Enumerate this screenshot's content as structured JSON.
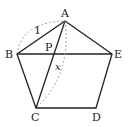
{
  "diagram": {
    "type": "geometry",
    "shape": "regular pentagon",
    "vertices": [
      {
        "label": "A",
        "x": 65,
        "y": 21
      },
      {
        "label": "B",
        "x": 17,
        "y": 54
      },
      {
        "label": "C",
        "x": 36,
        "y": 108
      },
      {
        "label": "D",
        "x": 96,
        "y": 108
      },
      {
        "label": "E",
        "x": 112,
        "y": 54
      }
    ],
    "intersection": {
      "label": "P",
      "x": 53,
      "y": 54
    },
    "segments": [
      "AB",
      "BC",
      "CD",
      "DE",
      "EA",
      "BE",
      "AC"
    ],
    "measurements": [
      {
        "segment": "AB",
        "label": "1",
        "style": "dashed-arc"
      },
      {
        "segment": "AC",
        "label": "x",
        "style": "dashed-arc"
      }
    ],
    "colors": {
      "stroke": "#222222",
      "dashed": "#999999",
      "background": "#ffffff"
    }
  },
  "labels": {
    "A": "A",
    "B": "B",
    "C": "C",
    "D": "D",
    "E": "E",
    "P": "P",
    "ab_length": "1",
    "ac_length": "x"
  }
}
